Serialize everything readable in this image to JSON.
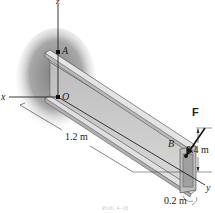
{
  "figure": {
    "axes": {
      "x": "x",
      "y": "y",
      "z": "z"
    },
    "points": {
      "A": "A",
      "O": "O",
      "B": "B"
    },
    "force": {
      "label": "F"
    },
    "dimensions": {
      "length": "1.2 m",
      "height": "0.4 m",
      "width": "0.2 m"
    },
    "caption": "Prob. 4–16"
  },
  "colors": {
    "beam_face": "#cfcfcf",
    "beam_top": "#e6e6e6",
    "beam_dark": "#a9a9a9",
    "wall_shadow": "#8a8a8a",
    "line": "#222222"
  }
}
